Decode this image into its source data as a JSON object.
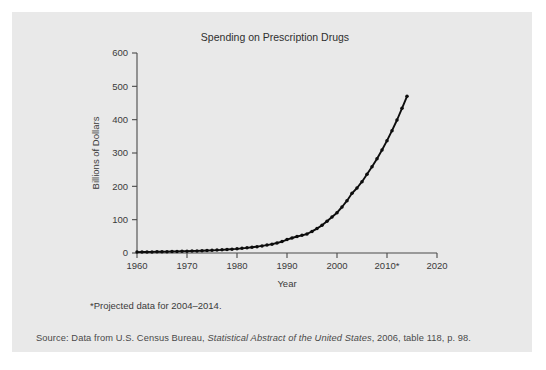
{
  "figure": {
    "title": "Spending on Prescription Drugs",
    "footnote": "*Projected data for 2004–2014.",
    "source": {
      "prefix": "Source: Data from U.S. Census Bureau, ",
      "italic_title": "Statistical Abstract of the United States",
      "suffix": ", 2006, table 118, p. 98."
    },
    "panel_color": "#e9e9e9",
    "ink_color": "#0d0d0d"
  },
  "chart_data": {
    "type": "line",
    "title": "Spending on Prescription Drugs",
    "xlabel": "Year",
    "ylabel": "Billions of Dollars",
    "xlim": [
      1960,
      2020
    ],
    "ylim": [
      0,
      600
    ],
    "xticks": [
      1960,
      1970,
      1980,
      1990,
      2000,
      2010,
      2020
    ],
    "xtick_labels": [
      "1960",
      "1970",
      "1980",
      "1990",
      "2000",
      "2010*",
      "2020"
    ],
    "yticks": [
      0,
      100,
      200,
      300,
      400,
      500,
      600
    ],
    "ytick_labels": [
      "0",
      "100",
      "200",
      "300",
      "400",
      "500",
      "600"
    ],
    "grid": false,
    "legend": "none",
    "markers": "filled-circle",
    "series": [
      {
        "name": "Prescription drug spending",
        "x": [
          1960,
          1961,
          1962,
          1963,
          1964,
          1965,
          1966,
          1967,
          1968,
          1969,
          1970,
          1971,
          1972,
          1973,
          1974,
          1975,
          1976,
          1977,
          1978,
          1979,
          1980,
          1981,
          1982,
          1983,
          1984,
          1985,
          1986,
          1987,
          1988,
          1989,
          1990,
          1991,
          1992,
          1993,
          1994,
          1995,
          1996,
          1997,
          1998,
          1999,
          2000,
          2001,
          2002,
          2003,
          2004,
          2005,
          2006,
          2007,
          2008,
          2009,
          2010,
          2011,
          2012,
          2013,
          2014
        ],
        "values": [
          2.7,
          2.9,
          3.1,
          3.3,
          3.6,
          3.8,
          4.1,
          4.4,
          4.8,
          5.2,
          5.5,
          5.9,
          6.3,
          6.7,
          7.3,
          8.0,
          8.7,
          9.4,
          10.3,
          11.5,
          12.5,
          13.9,
          15.4,
          17.1,
          19.0,
          21.2,
          23.7,
          26.5,
          30.0,
          34.3,
          40.3,
          45.0,
          49.5,
          53.0,
          57.0,
          64.7,
          73.3,
          83.0,
          95.0,
          108.0,
          121.0,
          138.0,
          157.0,
          179.0,
          195.0,
          214.0,
          236.0,
          259.0,
          283.0,
          309.0,
          337.0,
          367.0,
          399.0,
          434.0,
          470.0
        ]
      }
    ]
  }
}
